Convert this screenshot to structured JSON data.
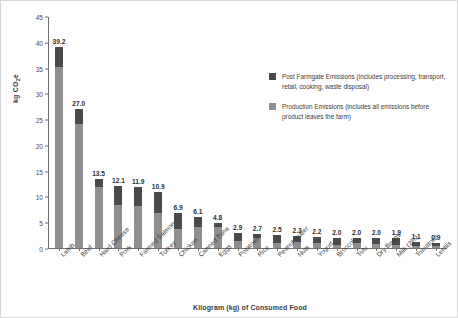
{
  "chart_data": {
    "type": "bar",
    "subtype": "stacked-vertical",
    "title": "",
    "xlabel": "Kilogram (kg) of Consumed Food",
    "ylabel": "kg CO2e",
    "ylabel_html": "kg CO<sub>2</sub>e",
    "ylim": [
      0,
      45
    ],
    "yticks": [
      0,
      5,
      10,
      15,
      20,
      25,
      30,
      35,
      40,
      45
    ],
    "grid": false,
    "legend_position": "upper-right-inside",
    "categories": [
      "Lamb",
      "Beef",
      "Hard Cheese",
      "Pork",
      "Farmed Salmon",
      "Turkey",
      "Chicken",
      "Canned Tuna",
      "Eggs",
      "Potatoes",
      "Rice",
      "Peanut Butter",
      "Nuts",
      "Yogurt",
      "Broccoli",
      "Tofu",
      "Dry Beans",
      "Milk (2%)",
      "Tomatoes",
      "Lentils"
    ],
    "totals": [
      39.2,
      27.0,
      13.5,
      12.1,
      11.9,
      10.9,
      6.9,
      6.1,
      4.8,
      2.9,
      2.7,
      2.5,
      2.3,
      2.2,
      2.0,
      2.0,
      2.0,
      1.9,
      1.1,
      0.9
    ],
    "series": [
      {
        "name": "Production Emissions (includes all emissions before product leaves the farm)",
        "color": "#8f8f8f",
        "values": [
          35.3,
          24.2,
          11.9,
          8.3,
          8.1,
          6.9,
          3.7,
          4.1,
          4.0,
          1.3,
          1.9,
          1.0,
          1.1,
          0.9,
          0.6,
          0.9,
          0.7,
          0.6,
          0.4,
          0.4
        ]
      },
      {
        "name": "Post Farmgate Emissions (includes processing, transport, retail, cooking, waste disposal)",
        "color": "#4a4a4a",
        "values": [
          3.9,
          2.8,
          1.6,
          3.8,
          3.8,
          4.0,
          3.2,
          2.0,
          0.8,
          1.6,
          0.8,
          1.5,
          1.2,
          1.3,
          1.4,
          1.1,
          1.3,
          1.3,
          0.7,
          0.5
        ]
      }
    ],
    "data_labels": [
      "39.2",
      "27.0",
      "13.5",
      "12.1",
      "11.9",
      "10.9",
      "6.9",
      "6.1",
      "4.8",
      "2.9",
      "2.7",
      "2.5",
      "2.3",
      "2.2",
      "2.0",
      "2.0",
      "2.0",
      "1.9",
      "1.1",
      "0.9"
    ],
    "legend": [
      {
        "label": "Post Farmgate Emissions (includes processing, transport, retail, cooking, waste disposal)",
        "color": "#4a4a4a"
      },
      {
        "label": "Production Emissions (includes all emissions before product leaves the farm)",
        "color": "#8f8f8f"
      }
    ]
  }
}
